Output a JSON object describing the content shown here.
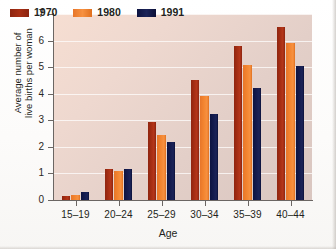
{
  "chart_data": {
    "type": "bar",
    "title": "",
    "xlabel": "Age",
    "ylabel": "Average number of live births per woman",
    "ylabel_lines": [
      "Average number of",
      "live births per woman"
    ],
    "categories": [
      "15–19",
      "20–24",
      "25–29",
      "30–34",
      "35–39",
      "40–44"
    ],
    "ylim": [
      0,
      7
    ],
    "yticks": [
      0,
      1,
      2,
      3,
      4,
      5,
      6,
      7
    ],
    "grid": true,
    "legend_position": "top-left-inside",
    "series": [
      {
        "name": "1970",
        "color": "#a32c12",
        "values": [
          0.15,
          1.17,
          2.95,
          4.5,
          5.8,
          6.5
        ]
      },
      {
        "name": "1980",
        "color": "#f3842f",
        "values": [
          0.2,
          1.1,
          2.45,
          3.9,
          5.1,
          5.9
        ]
      },
      {
        "name": "1991",
        "color": "#141b4e",
        "values": [
          0.3,
          1.18,
          2.2,
          3.25,
          4.2,
          5.05
        ]
      }
    ]
  },
  "colors": {
    "series_1970": "#a32c12",
    "series_1980": "#f3842f",
    "series_1991": "#141b4e",
    "plot_background": "#eed8cf",
    "gridline": "#ffffff",
    "axis": "#6b6663",
    "text": "#231f20"
  }
}
